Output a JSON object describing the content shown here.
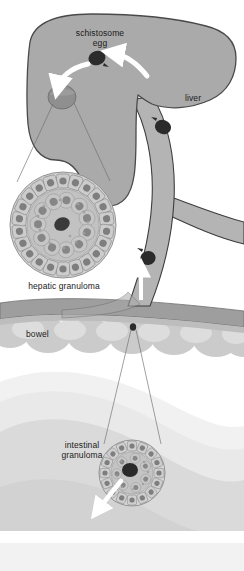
{
  "figure": {
    "background_color": "#ffffff"
  },
  "labels": {
    "egg": "schistosome\negg",
    "liver": "liver",
    "hepatic_granuloma": "hepatic granuloma",
    "bowel": "bowel",
    "intestinal_granuloma": "intestinal\ngranuloma"
  },
  "colors": {
    "liver_fill": "#aaaaaa",
    "liver_outline": "#4a4a4a",
    "vessel_fill": "#b4b4b4",
    "vessel_outline": "#3d3d3d",
    "egg_dark": "#2b2b2b",
    "granuloma_site": "#8f8f8f",
    "bowel_band": "#9e9e9e",
    "bowel_lobe": "#cfcfcf",
    "tissue_light": "#e2e2e2",
    "tissue_lighter": "#efefef",
    "arrow_white": "#ffffff",
    "leader_line": "#6e6e6e",
    "cell_fill": "#c9c9c9",
    "cell_nucleus": "#7a7a7a",
    "text": "#1a1a1a"
  },
  "anatomy": {
    "liver": {
      "name": "liver",
      "description": "large lobed organ, upper portion"
    },
    "portal_vein": {
      "name": "portal-vein",
      "description": "vessel ascending from bowel into liver, with right branch"
    },
    "bowel": {
      "name": "bowel",
      "description": "scalloped intestinal wall bands"
    }
  },
  "eggs": [
    {
      "id": "egg-liver-parenchyma",
      "cx": 97,
      "cy": 58,
      "rx": 8.5,
      "ry": 7
    },
    {
      "id": "egg-vein-upper",
      "cx": 163,
      "cy": 127,
      "rx": 8,
      "ry": 7
    },
    {
      "id": "egg-vein-lower",
      "cx": 148,
      "cy": 258,
      "rx": 7.5,
      "ry": 7
    },
    {
      "id": "egg-bowel-wall",
      "cx": 133,
      "cy": 327,
      "rx": 3.2,
      "ry": 3.6
    }
  ],
  "granulomas": [
    {
      "id": "hepatic-granuloma",
      "label": "hepatic granuloma",
      "cx": 63,
      "cy": 225,
      "r": 53,
      "outer_cells": 22,
      "inner_cells": 11,
      "center_egg": true
    },
    {
      "id": "intestinal-granuloma",
      "label": "intestinal\ngranuloma",
      "cx": 132,
      "cy": 473,
      "r": 33,
      "outer_cells": 16,
      "inner_cells": 7,
      "center_egg": true
    }
  ],
  "arrows": [
    {
      "id": "arrow-vein-to-egg",
      "description": "white arrow pointing left toward schistosome egg"
    },
    {
      "id": "arrow-egg-to-granuloma",
      "description": "white curved arrow from egg down to hepatic granuloma site"
    },
    {
      "id": "arrow-portal-flow",
      "description": "white arrow up the portal vein into the liver"
    },
    {
      "id": "arrow-bowel-lumen",
      "description": "white arrow from intestinal granuloma into bowel lumen"
    }
  ]
}
